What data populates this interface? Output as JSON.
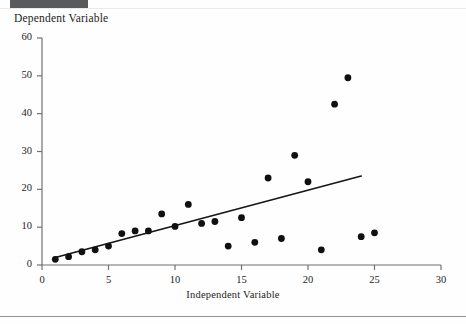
{
  "figure": {
    "y_axis_title": "Dependent Variable",
    "x_axis_title": "Independent Variable"
  },
  "chart_data": {
    "type": "scatter",
    "title": "",
    "xlabel": "Independent Variable",
    "ylabel": "Dependent Variable",
    "xlim": [
      0,
      30
    ],
    "ylim": [
      0,
      60
    ],
    "xticks": [
      0,
      5,
      10,
      15,
      20,
      25,
      30
    ],
    "yticks": [
      0,
      10,
      20,
      30,
      40,
      50,
      60
    ],
    "grid": false,
    "legend": null,
    "marker_color": "#101010",
    "line_color": "#151515",
    "points": [
      {
        "x": 1,
        "y": 1.5
      },
      {
        "x": 2,
        "y": 2.2
      },
      {
        "x": 3,
        "y": 3.5
      },
      {
        "x": 4,
        "y": 4.0
      },
      {
        "x": 5,
        "y": 5.0
      },
      {
        "x": 6,
        "y": 8.3
      },
      {
        "x": 7,
        "y": 9.0
      },
      {
        "x": 8,
        "y": 9.0
      },
      {
        "x": 9,
        "y": 13.5
      },
      {
        "x": 10,
        "y": 10.2
      },
      {
        "x": 11,
        "y": 16.0
      },
      {
        "x": 12,
        "y": 11.0
      },
      {
        "x": 13,
        "y": 11.5
      },
      {
        "x": 14,
        "y": 5.0
      },
      {
        "x": 15,
        "y": 12.5
      },
      {
        "x": 16,
        "y": 6.0
      },
      {
        "x": 17,
        "y": 23.0
      },
      {
        "x": 18,
        "y": 7.0
      },
      {
        "x": 19,
        "y": 29.0
      },
      {
        "x": 20,
        "y": 22.0
      },
      {
        "x": 21,
        "y": 4.0
      },
      {
        "x": 22,
        "y": 42.5
      },
      {
        "x": 23,
        "y": 49.5
      },
      {
        "x": 24,
        "y": 7.5
      },
      {
        "x": 25,
        "y": 8.5
      }
    ],
    "trendline": {
      "x_start": 1,
      "y_start": 2.0,
      "x_end": 24,
      "y_end": 23.5
    }
  }
}
